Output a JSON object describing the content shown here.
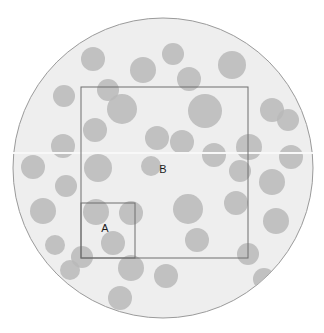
{
  "figure": {
    "width": 324,
    "height": 333,
    "background_color": "#ffffff"
  },
  "field": {
    "name": "circular-field",
    "shape": "circle",
    "cx": 163,
    "cy": 168,
    "r": 150,
    "fill_color": "#eeeeee",
    "stroke_color": "#9a9a9a",
    "stroke_width": 1,
    "highlight_band": {
      "y": 152,
      "height": 2,
      "color": "#f8f8f8"
    }
  },
  "quadrats": [
    {
      "id": "A",
      "label": "A",
      "x": 81,
      "y": 203,
      "width": 54,
      "height": 55,
      "label_x": 105,
      "label_y": 229,
      "stroke_color": "#6e6e6e",
      "stroke_width": 1,
      "fill": "none"
    },
    {
      "id": "B",
      "label": "B",
      "x": 81,
      "y": 87,
      "width": 167,
      "height": 171,
      "label_x": 163,
      "label_y": 170,
      "stroke_color": "#6e6e6e",
      "stroke_width": 1,
      "fill": "none"
    }
  ],
  "particles": {
    "name": "scattered-particles",
    "count": 40,
    "fill_color": "#b9b9b9",
    "opacity": 0.85,
    "items": [
      {
        "cx": 93,
        "cy": 59,
        "r": 12
      },
      {
        "cx": 143,
        "cy": 70,
        "r": 13
      },
      {
        "cx": 189,
        "cy": 79,
        "r": 12
      },
      {
        "cx": 232,
        "cy": 65,
        "r": 14
      },
      {
        "cx": 64,
        "cy": 96,
        "r": 11
      },
      {
        "cx": 122,
        "cy": 109,
        "r": 15
      },
      {
        "cx": 272,
        "cy": 110,
        "r": 12
      },
      {
        "cx": 95,
        "cy": 130,
        "r": 12
      },
      {
        "cx": 205,
        "cy": 111,
        "r": 17
      },
      {
        "cx": 63,
        "cy": 146,
        "r": 12
      },
      {
        "cx": 157,
        "cy": 138,
        "r": 12
      },
      {
        "cx": 182,
        "cy": 142,
        "r": 12
      },
      {
        "cx": 249,
        "cy": 147,
        "r": 13
      },
      {
        "cx": 33,
        "cy": 167,
        "r": 12
      },
      {
        "cx": 98,
        "cy": 168,
        "r": 14
      },
      {
        "cx": 214,
        "cy": 155,
        "r": 12
      },
      {
        "cx": 272,
        "cy": 182,
        "r": 13
      },
      {
        "cx": 66,
        "cy": 186,
        "r": 11
      },
      {
        "cx": 43,
        "cy": 211,
        "r": 13
      },
      {
        "cx": 188,
        "cy": 209,
        "r": 15
      },
      {
        "cx": 236,
        "cy": 203,
        "r": 12
      },
      {
        "cx": 96,
        "cy": 212,
        "r": 13
      },
      {
        "cx": 131,
        "cy": 213,
        "r": 12
      },
      {
        "cx": 276,
        "cy": 221,
        "r": 13
      },
      {
        "cx": 113,
        "cy": 243,
        "r": 12
      },
      {
        "cx": 197,
        "cy": 240,
        "r": 12
      },
      {
        "cx": 82,
        "cy": 257,
        "r": 11
      },
      {
        "cx": 248,
        "cy": 254,
        "r": 11
      },
      {
        "cx": 131,
        "cy": 268,
        "r": 13
      },
      {
        "cx": 166,
        "cy": 276,
        "r": 12
      },
      {
        "cx": 264,
        "cy": 279,
        "r": 11
      },
      {
        "cx": 120,
        "cy": 298,
        "r": 12
      },
      {
        "cx": 70,
        "cy": 270,
        "r": 10
      },
      {
        "cx": 291,
        "cy": 157,
        "r": 12
      },
      {
        "cx": 288,
        "cy": 120,
        "r": 11
      },
      {
        "cx": 240,
        "cy": 171,
        "r": 11
      },
      {
        "cx": 151,
        "cy": 166,
        "r": 10
      },
      {
        "cx": 108,
        "cy": 90,
        "r": 11
      },
      {
        "cx": 173,
        "cy": 54,
        "r": 11
      },
      {
        "cx": 55,
        "cy": 245,
        "r": 10
      }
    ]
  }
}
